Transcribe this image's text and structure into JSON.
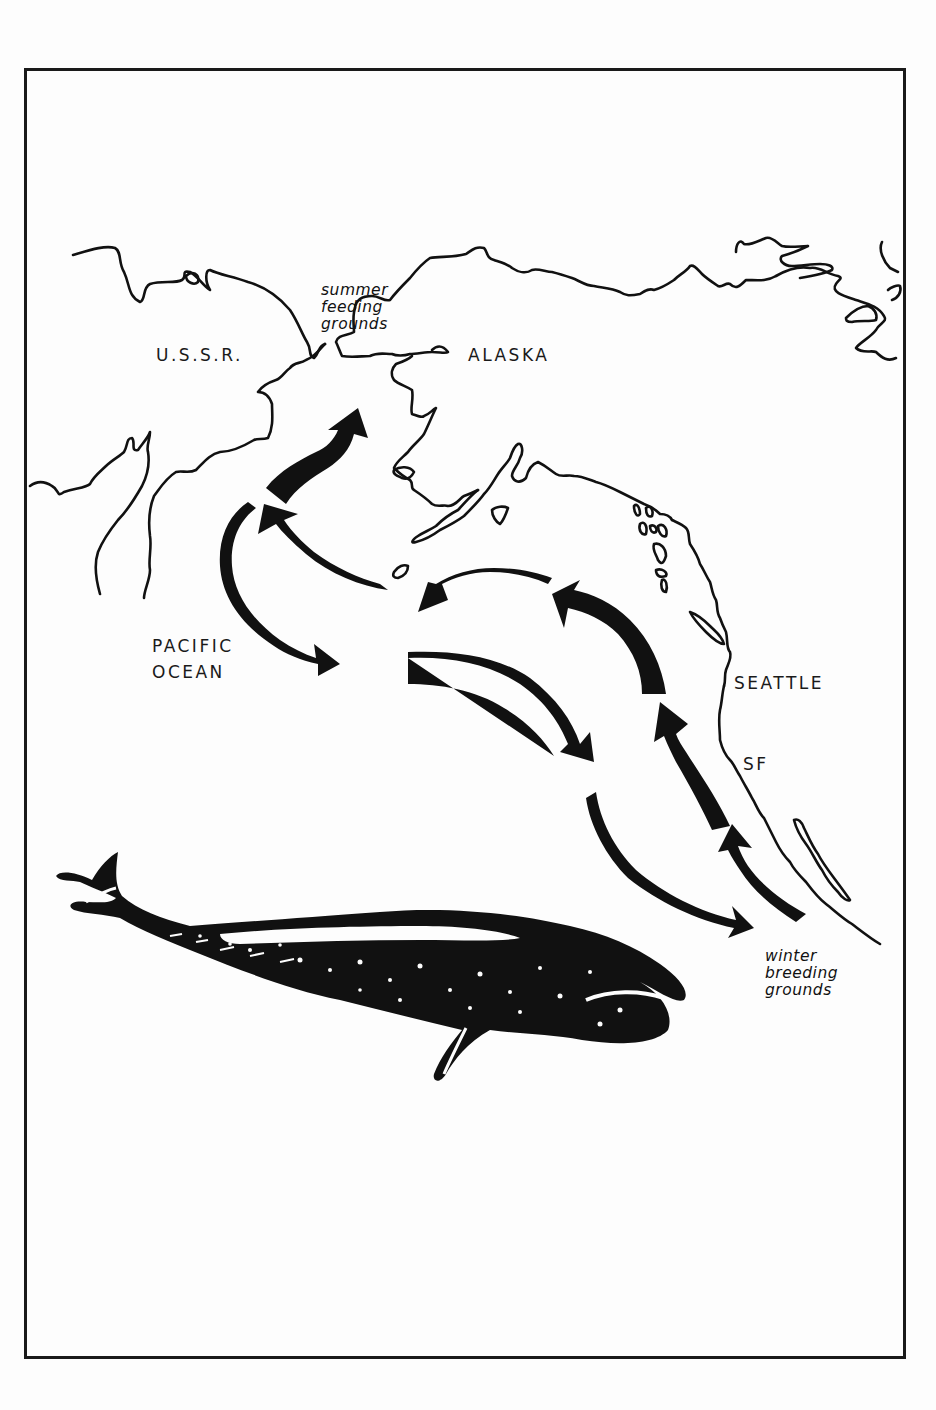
{
  "figure": {
    "type": "migration-map",
    "colors": {
      "ink": "#111111",
      "paper": "#fdfdfd",
      "frame": "#1a1a1a"
    }
  },
  "labels": {
    "ussr": "U.S.S.R.",
    "alaska": "ALASKA",
    "pacific_line1": "PACIFIC",
    "pacific_line2": "OCEAN",
    "seattle": "SEATTLE",
    "sf": "SF",
    "summer_line1": "summer",
    "summer_line2": "feeding",
    "summer_line3": "grounds",
    "winter_line1": "winter",
    "winter_line2": "breeding",
    "winter_line3": "grounds"
  },
  "map_features": {
    "regions": [
      "U.S.S.R.",
      "ALASKA",
      "PACIFIC OCEAN"
    ],
    "cities": [
      "SEATTLE",
      "SF"
    ],
    "areas": [
      "summer feeding grounds",
      "winter breeding grounds"
    ],
    "illustration": "gray whale"
  },
  "routes": [
    {
      "id": "north-1",
      "direction": "northbound",
      "description": "arrow toward summer feeding grounds"
    },
    {
      "id": "north-2",
      "direction": "northbound",
      "description": "arrow curving northwest"
    },
    {
      "id": "north-3",
      "direction": "northbound",
      "description": "arrow westward across Gulf of Alaska"
    },
    {
      "id": "north-4",
      "direction": "northbound",
      "description": "arrow northwest along coast"
    },
    {
      "id": "north-5",
      "direction": "northbound",
      "description": "arrow north near Seattle"
    },
    {
      "id": "north-6",
      "direction": "northbound",
      "description": "arrow north from winter breeding grounds"
    },
    {
      "id": "south-1",
      "direction": "southbound",
      "description": "arrow south from Bering Sea"
    },
    {
      "id": "south-2",
      "direction": "southbound",
      "description": "arrow southeast across Pacific"
    },
    {
      "id": "south-3",
      "direction": "southbound",
      "description": "arrow toward winter breeding grounds"
    }
  ]
}
